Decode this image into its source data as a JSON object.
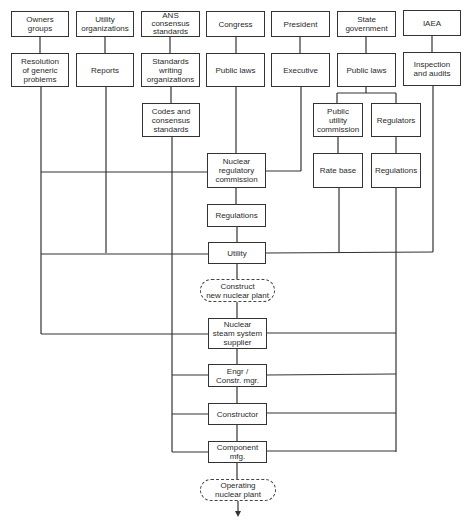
{
  "diagram": {
    "top_row": [
      {
        "id": "owners",
        "label": "Owners\ngroups"
      },
      {
        "id": "utility_orgs",
        "label": "Utility\norganizations"
      },
      {
        "id": "ans",
        "label": "ANS\nconsensus\nstandards"
      },
      {
        "id": "congress",
        "label": "Congress"
      },
      {
        "id": "president",
        "label": "President"
      },
      {
        "id": "state_gov",
        "label": "State\ngovernment"
      },
      {
        "id": "iaea",
        "label": "IAEA"
      }
    ],
    "second_row": [
      {
        "id": "resolution",
        "label": "Resolution\nof generic\nproblems"
      },
      {
        "id": "reports",
        "label": "Reports"
      },
      {
        "id": "standards_writing",
        "label": "Standards\nwriting\norganizations"
      },
      {
        "id": "public_laws_fed",
        "label": "Public laws"
      },
      {
        "id": "executive",
        "label": "Executive"
      },
      {
        "id": "public_laws_state",
        "label": "Public laws"
      },
      {
        "id": "inspection",
        "label": "Inspection\nand audits"
      }
    ],
    "codes": {
      "label": "Codes and\nconsensus\nstandards"
    },
    "puc": {
      "label": "Public\nutility\ncommission"
    },
    "regulators": {
      "label": "Regulators"
    },
    "rate_base": {
      "label": "Rate base"
    },
    "state_regulations": {
      "label": "Regulations"
    },
    "nrc": {
      "label": "Nuclear\nregulatory\ncommission"
    },
    "nrc_regulations": {
      "label": "Regulations"
    },
    "utility": {
      "label": "Utility"
    },
    "construct": {
      "label": "Construct\nnew nuclear plant"
    },
    "nsss": {
      "label": "Nuclear\nsteam system\nsupplier"
    },
    "engr": {
      "label": "Engr /\nConstr. mgr."
    },
    "constructor": {
      "label": "Constructor"
    },
    "component": {
      "label": "Component\nmfg."
    },
    "operating": {
      "label": "Operating\nnuclear plant"
    }
  },
  "colors": {
    "line": "#333333",
    "background": "#ffffff"
  }
}
